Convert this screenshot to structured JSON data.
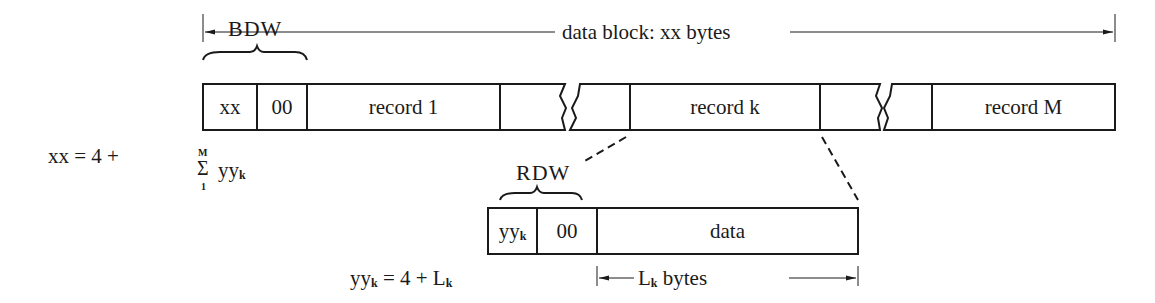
{
  "diagram": {
    "block": {
      "dimension_label": "data block: xx bytes",
      "bdw_label": "BDW",
      "cells": {
        "xx": "xx",
        "zero": "00",
        "record_1": "record 1",
        "record_k": "record k",
        "record_m": "record M"
      }
    },
    "formula_block": {
      "lhs": "xx = 4 +",
      "sigma": "Σ",
      "upper": "M",
      "lower": "1",
      "term": "yy",
      "term_sub": "k"
    },
    "record": {
      "rdw_label": "RDW",
      "cells": {
        "yy": "yy",
        "yy_sub": "k",
        "zero": "00",
        "data": "data"
      },
      "dimension_label": "L",
      "dimension_sub": "k",
      "dimension_suffix": " bytes"
    },
    "formula_record": {
      "lhs": "yy",
      "lhs_sub": "k",
      "mid": " = 4 + L",
      "rhs_sub": "k"
    },
    "colors": {
      "line": "#1a1a1a",
      "background": "#ffffff"
    }
  }
}
